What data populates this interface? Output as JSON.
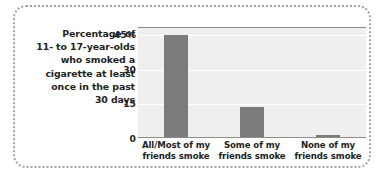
{
  "caption": {
    "lines": [
      "Percentage of",
      "11- to 17-year-olds",
      "who smoked a",
      "cigarette at least",
      "once in the past",
      "30 days"
    ],
    "text": "Percentage of 11- to 17-year-olds who smoked a cigarette at least once in the past 30 days"
  },
  "colors": {
    "bar": "#7d7b79",
    "plot_background": "#f1efed",
    "gridline": "#ffffff",
    "axis": "#8e8c8a",
    "frame": "#a9a29c",
    "text": "#231f20"
  },
  "chart_data": {
    "type": "bar",
    "title": "Percentage of 11- to 17-year-olds who smoked a cigarette at least once in the past 30 days",
    "categories": [
      "All/Most of my friends smoke",
      "Some of my friends smoke",
      "None of my friends smoke"
    ],
    "category_lines": [
      [
        "All/Most of my",
        "friends smoke"
      ],
      [
        "Some of my",
        "friends smoke"
      ],
      [
        "None of my",
        "friends smoke"
      ]
    ],
    "values": [
      44,
      13,
      1
    ],
    "xlabel": "",
    "ylabel": "",
    "ylim": [
      0,
      48
    ],
    "yticks": [
      0,
      15,
      30,
      45
    ],
    "ytick_labels": [
      "0",
      "15",
      "30",
      "45%"
    ],
    "grid": true,
    "legend": false
  }
}
